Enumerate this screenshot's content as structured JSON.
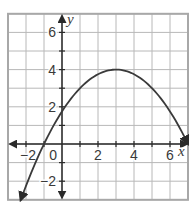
{
  "chart_data": {
    "type": "line",
    "title": "",
    "xlabel": "x",
    "ylabel": "y",
    "xlim": [
      -3,
      7
    ],
    "ylim": [
      -3,
      7
    ],
    "grid": true,
    "grid_step": 1,
    "x_tick_labels": [
      {
        "value": -2,
        "label": "−2"
      },
      {
        "value": 0,
        "label": "0"
      },
      {
        "value": 2,
        "label": "2"
      },
      {
        "value": 4,
        "label": "4"
      },
      {
        "value": 6,
        "label": "6"
      }
    ],
    "y_tick_labels": [
      {
        "value": 6,
        "label": "6"
      },
      {
        "value": 4,
        "label": "4"
      },
      {
        "value": 2,
        "label": "2"
      },
      {
        "value": -2,
        "label": "−2"
      }
    ],
    "series": [
      {
        "name": "parabola",
        "equation": "y = -0.25(x - 3)^2 + 4",
        "vertex": [
          3,
          4
        ],
        "x_intercepts": [
          -1,
          7
        ],
        "y_intercept": 1.75,
        "x_range": [
          -2.3,
          7
        ],
        "arrows_at_ends": true,
        "x": [
          -2.3,
          -2,
          -1,
          0,
          1,
          2,
          3,
          4,
          5,
          6,
          7
        ],
        "values": [
          -3.02,
          -2.25,
          0,
          1.75,
          3,
          3.75,
          4,
          3.75,
          3,
          1.75,
          0
        ]
      }
    ],
    "colors": {
      "grid": "#b8b8b8",
      "border": "#a8a8a8",
      "axis": "#2a2a2a",
      "curve": "#3a3a3a"
    }
  }
}
